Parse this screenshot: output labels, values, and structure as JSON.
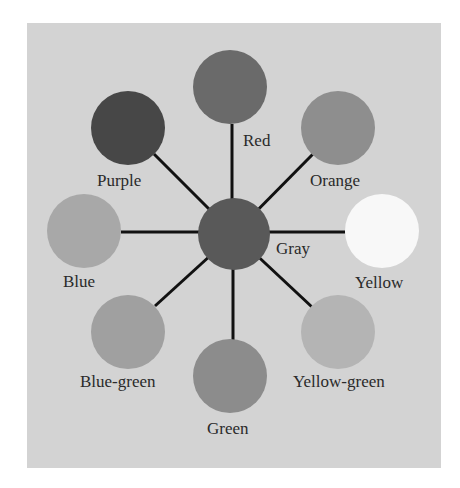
{
  "diagram": {
    "type": "color-wheel",
    "center": {
      "label": "Gray",
      "color": "#595959",
      "cx": 234,
      "cy": 234,
      "r": 36
    },
    "line_color": "#111111",
    "nodes": [
      {
        "label": "Red",
        "color": "#6a6a6a",
        "cx": 230,
        "cy": 87,
        "r": 37
      },
      {
        "label": "Orange",
        "color": "#8e8e8e",
        "cx": 338,
        "cy": 128,
        "r": 37
      },
      {
        "label": "Yellow",
        "color": "#f8f8f8",
        "cx": 382,
        "cy": 231,
        "r": 37
      },
      {
        "label": "Yellow-green",
        "color": "#b4b4b4",
        "cx": 338,
        "cy": 332,
        "r": 37
      },
      {
        "label": "Green",
        "color": "#8c8c8c",
        "cx": 230,
        "cy": 376,
        "r": 37
      },
      {
        "label": "Blue-green",
        "color": "#a0a0a0",
        "cx": 128,
        "cy": 332,
        "r": 37
      },
      {
        "label": "Blue",
        "color": "#a8a8a8",
        "cx": 84,
        "cy": 231,
        "r": 37
      },
      {
        "label": "Purple",
        "color": "#474747",
        "cx": 128,
        "cy": 128,
        "r": 37
      }
    ]
  },
  "labels": {
    "red": "Red",
    "orange": "Orange",
    "yellow": "Yellow",
    "yellow_green": "Yellow-green",
    "green": "Green",
    "blue_green": "Blue-green",
    "blue": "Blue",
    "purple": "Purple",
    "gray": "Gray"
  },
  "colors": {
    "page_bg": "#ffffff",
    "panel_bg": "#d3d3d3",
    "text": "#2a2a2a"
  }
}
